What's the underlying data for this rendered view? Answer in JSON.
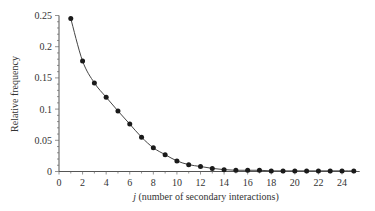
{
  "chart_data": {
    "type": "line",
    "title": "",
    "xlabel_italic": "j",
    "xlabel_rest": " (number of secondary interactions)",
    "xlabel": "j (number of secondary interactions)",
    "ylabel": "Relative frequency",
    "xlim": [
      0,
      25.5
    ],
    "ylim": [
      0,
      0.25
    ],
    "xticks": [
      0,
      2,
      4,
      6,
      8,
      10,
      12,
      14,
      16,
      18,
      20,
      22,
      24
    ],
    "yticks": [
      0,
      0.05,
      0.1,
      0.15,
      0.2,
      0.25
    ],
    "ytick_labels": [
      "0",
      "0.05",
      "0.1",
      "0.15",
      "0.2",
      "0.25"
    ],
    "grid": false,
    "legend": null,
    "series": [
      {
        "name": "Relative frequency",
        "marker": "circle",
        "color": "#1a1a1a",
        "x": [
          1,
          2,
          3,
          4,
          5,
          6,
          7,
          8,
          9,
          10,
          11,
          12,
          13,
          14,
          15,
          16,
          17,
          18,
          19,
          20,
          21,
          22,
          23,
          24,
          25
        ],
        "values": [
          0.245,
          0.177,
          0.142,
          0.119,
          0.097,
          0.076,
          0.055,
          0.038,
          0.027,
          0.017,
          0.011,
          0.008,
          0.005,
          0.003,
          0.002,
          0.002,
          0.002,
          0.001,
          0.001,
          0.001,
          0.001,
          0.001,
          0.001,
          0.001,
          0.001
        ]
      }
    ]
  }
}
